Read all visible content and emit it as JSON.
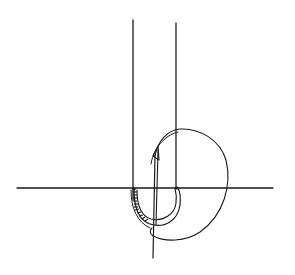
{
  "diagram": {
    "title": "",
    "stroke_color": "#1a1a1a",
    "background_color": "#ffffff",
    "elements": [
      {
        "name": "left-vertical-line"
      },
      {
        "name": "right-vertical-line"
      },
      {
        "name": "horizontal-surface-line"
      },
      {
        "name": "suture-loop"
      },
      {
        "name": "curved-needle"
      },
      {
        "name": "needle-holder-shaft"
      },
      {
        "name": "hatched-tissue-arc"
      }
    ]
  }
}
